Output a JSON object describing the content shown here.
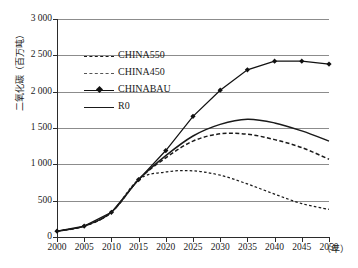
{
  "chart_data": {
    "type": "line",
    "title": "",
    "xlabel": "（年）",
    "ylabel": "二氧化碳（百万吨）",
    "x": [
      2000,
      2005,
      2010,
      2015,
      2020,
      2025,
      2030,
      2035,
      2040,
      2045,
      2050
    ],
    "xlim": [
      2000,
      2050
    ],
    "ylim": [
      0,
      3000
    ],
    "ytick_labels": [
      "3 000",
      "2 500",
      "2 000",
      "1 500",
      "1 000",
      "500",
      "0"
    ],
    "ytick_values": [
      3000,
      2500,
      2000,
      1500,
      1000,
      500,
      0
    ],
    "xtick_labels": [
      "2000",
      "2005",
      "2010",
      "2015",
      "2020",
      "2025",
      "2030",
      "2035",
      "2040",
      "2045",
      "2050"
    ],
    "grid": true,
    "legend_position": "upper-left-inside",
    "series": [
      {
        "name": "CHINA550",
        "style": "dashed",
        "marker": "none",
        "color": "#1a1a1a",
        "values": [
          80,
          150,
          340,
          790,
          1090,
          1320,
          1420,
          1415,
          1340,
          1230,
          1070
        ]
      },
      {
        "name": "CHINA450",
        "style": "dotted",
        "marker": "none",
        "color": "#1a1a1a",
        "values": [
          80,
          150,
          340,
          790,
          895,
          910,
          850,
          730,
          590,
          460,
          380
        ]
      },
      {
        "name": "CHINABAU",
        "style": "solid",
        "marker": "diamond",
        "color": "#111111",
        "values": [
          80,
          150,
          340,
          790,
          1190,
          1660,
          2020,
          2300,
          2420,
          2420,
          2380
        ]
      },
      {
        "name": "R0",
        "style": "solid",
        "marker": "none",
        "color": "#1a1a1a",
        "values": [
          80,
          150,
          340,
          790,
          1120,
          1390,
          1550,
          1620,
          1570,
          1460,
          1320
        ]
      }
    ]
  },
  "legend": {
    "items": [
      {
        "label": "CHINA550",
        "style": "dashed",
        "marker": "none"
      },
      {
        "label": "CHINA450",
        "style": "dotted",
        "marker": "none"
      },
      {
        "label": "CHINABAU",
        "style": "solid",
        "marker": "diamond"
      },
      {
        "label": "R0",
        "style": "solid",
        "marker": "none"
      }
    ]
  },
  "axes": {
    "y_title": "二氧化碳（百万吨）",
    "x_unit": "（年）"
  }
}
